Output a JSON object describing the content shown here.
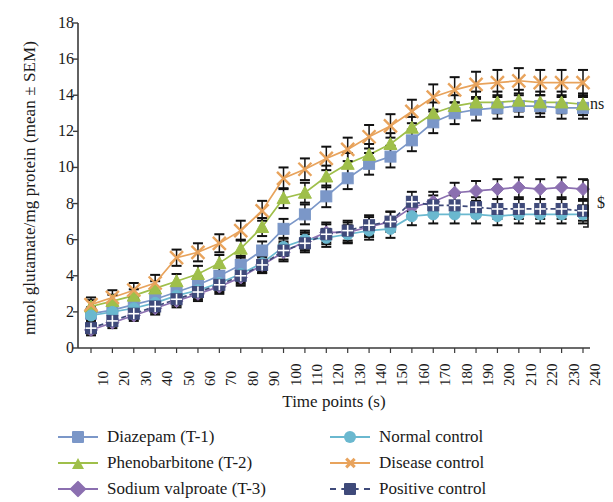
{
  "chart_data": {
    "type": "line",
    "title": "",
    "xlabel": "Time points (s)",
    "ylabel": "nmol glutamate/mg protein (mean ± SEM)",
    "xlim": [
      10,
      240
    ],
    "ylim": [
      0,
      18
    ],
    "ytick_step": 2,
    "yticks": [
      18,
      16,
      14,
      12,
      10,
      8,
      6,
      4,
      2,
      0
    ],
    "grid": false,
    "legend_position": "bottom",
    "errorbars": "SEM",
    "x": [
      10,
      20,
      30,
      40,
      50,
      60,
      70,
      80,
      90,
      100,
      110,
      120,
      130,
      140,
      150,
      160,
      170,
      180,
      190,
      200,
      210,
      220,
      230,
      240
    ],
    "categories": [
      "10",
      "20",
      "30",
      "40",
      "50",
      "60",
      "70",
      "80",
      "90",
      "100",
      "110",
      "120",
      "130",
      "140",
      "150",
      "160",
      "170",
      "180",
      "190",
      "200",
      "210",
      "220",
      "230",
      "240"
    ],
    "series": [
      {
        "name": "Diazepam (T-1)",
        "key": "diazepam",
        "color": "#7b97c8",
        "marker": "square",
        "line": "solid",
        "values": [
          1.9,
          2.1,
          2.4,
          2.7,
          3.1,
          3.5,
          4.0,
          4.6,
          5.4,
          6.6,
          7.4,
          8.4,
          9.4,
          10.2,
          10.6,
          11.5,
          12.5,
          13.0,
          13.2,
          13.3,
          13.4,
          13.4,
          13.3,
          13.3
        ],
        "errors": [
          0.35,
          0.35,
          0.35,
          0.4,
          0.4,
          0.45,
          0.45,
          0.5,
          0.5,
          0.55,
          0.55,
          0.6,
          0.6,
          0.6,
          0.6,
          0.6,
          0.6,
          0.6,
          0.6,
          0.6,
          0.6,
          0.6,
          0.6,
          0.6
        ]
      },
      {
        "name": "Phenobarbitone (T-2)",
        "key": "phenobarbitone",
        "color": "#9fbf4a",
        "marker": "triangle",
        "line": "solid",
        "values": [
          2.3,
          2.6,
          2.9,
          3.3,
          3.7,
          4.1,
          4.7,
          5.5,
          6.7,
          8.3,
          8.6,
          9.5,
          10.2,
          10.7,
          11.3,
          12.2,
          13.0,
          13.4,
          13.6,
          13.6,
          13.7,
          13.6,
          13.6,
          13.5
        ],
        "errors": [
          0.35,
          0.35,
          0.35,
          0.4,
          0.4,
          0.45,
          0.45,
          0.5,
          0.5,
          0.55,
          0.55,
          0.6,
          0.6,
          0.6,
          0.6,
          0.6,
          0.6,
          0.6,
          0.6,
          0.6,
          0.6,
          0.6,
          0.6,
          0.6
        ]
      },
      {
        "name": "Sodium valproate (T-3)",
        "key": "sodium_valproate",
        "color": "#8b6fb0",
        "marker": "diamond",
        "line": "solid",
        "values": [
          1.0,
          1.4,
          1.8,
          2.2,
          2.6,
          3.0,
          3.4,
          3.9,
          4.6,
          5.3,
          5.9,
          6.4,
          6.4,
          6.7,
          7.0,
          7.8,
          8.1,
          8.6,
          8.7,
          8.8,
          8.9,
          8.8,
          8.9,
          8.8
        ],
        "errors": [
          0.3,
          0.3,
          0.3,
          0.35,
          0.35,
          0.4,
          0.4,
          0.45,
          0.45,
          0.5,
          0.5,
          0.55,
          0.55,
          0.55,
          0.55,
          0.55,
          0.55,
          0.55,
          0.55,
          0.55,
          0.55,
          0.55,
          0.55,
          0.55
        ]
      },
      {
        "name": "Normal control",
        "key": "normal_control",
        "color": "#6ab8cf",
        "marker": "circle",
        "line": "solid",
        "values": [
          1.8,
          2.0,
          2.2,
          2.5,
          2.9,
          3.2,
          3.6,
          4.1,
          4.7,
          5.6,
          6.0,
          6.1,
          6.3,
          6.5,
          6.6,
          7.3,
          7.4,
          7.4,
          7.4,
          7.3,
          7.4,
          7.4,
          7.4,
          7.4
        ],
        "errors": [
          0.3,
          0.3,
          0.3,
          0.35,
          0.35,
          0.4,
          0.4,
          0.45,
          0.45,
          0.5,
          0.5,
          0.5,
          0.5,
          0.5,
          0.5,
          0.5,
          0.5,
          0.5,
          0.5,
          0.5,
          0.5,
          0.5,
          0.5,
          0.5
        ]
      },
      {
        "name": "Disease control",
        "key": "disease_control",
        "color": "#e8a35c",
        "marker": "x",
        "line": "solid",
        "values": [
          2.4,
          2.8,
          3.2,
          3.6,
          5.0,
          5.3,
          5.8,
          6.5,
          7.6,
          9.4,
          9.9,
          10.5,
          11.0,
          11.7,
          12.3,
          13.1,
          13.9,
          14.3,
          14.6,
          14.7,
          14.8,
          14.7,
          14.7,
          14.7
        ],
        "errors": [
          0.4,
          0.4,
          0.4,
          0.45,
          0.45,
          0.5,
          0.5,
          0.55,
          0.55,
          0.6,
          0.6,
          0.65,
          0.65,
          0.65,
          0.65,
          0.65,
          0.7,
          0.7,
          0.7,
          0.7,
          0.7,
          0.7,
          0.7,
          0.7
        ]
      },
      {
        "name": "Positive control",
        "key": "positive_control",
        "color": "#3f4a7a",
        "marker": "square-grid",
        "line": "dashed",
        "values": [
          1.1,
          1.5,
          1.9,
          2.3,
          2.7,
          3.1,
          3.5,
          4.0,
          4.6,
          5.4,
          5.8,
          6.3,
          6.5,
          6.8,
          7.0,
          8.1,
          7.9,
          7.9,
          7.8,
          7.7,
          7.7,
          7.7,
          7.7,
          7.6
        ],
        "errors": [
          0.3,
          0.3,
          0.3,
          0.35,
          0.35,
          0.4,
          0.4,
          0.45,
          0.45,
          0.5,
          0.5,
          0.55,
          0.55,
          0.55,
          0.55,
          0.55,
          0.55,
          0.55,
          0.55,
          0.55,
          0.55,
          0.55,
          0.55,
          0.55
        ]
      }
    ],
    "annotations": [
      {
        "key": "ns",
        "text": "ns",
        "y": 13.5,
        "note": "right of plateau of upper group"
      },
      {
        "key": "dollar",
        "text": "$",
        "y": 8.0,
        "note": "bracket right of lower group"
      }
    ]
  },
  "legend": {
    "left_items": [
      {
        "label": "Diazepam (T-1)",
        "series_key": "diazepam"
      },
      {
        "label": "Phenobarbitone (T-2)",
        "series_key": "phenobarbitone"
      },
      {
        "label": "Sodium valproate (T-3)",
        "series_key": "sodium_valproate"
      }
    ],
    "right_items": [
      {
        "label": "Normal control",
        "series_key": "normal_control"
      },
      {
        "label": "Disease control",
        "series_key": "disease_control"
      },
      {
        "label": "Positive control",
        "series_key": "positive_control"
      }
    ]
  },
  "axes": {
    "axis_color": "#3a3a3a",
    "errorbar_color": "#111111"
  }
}
